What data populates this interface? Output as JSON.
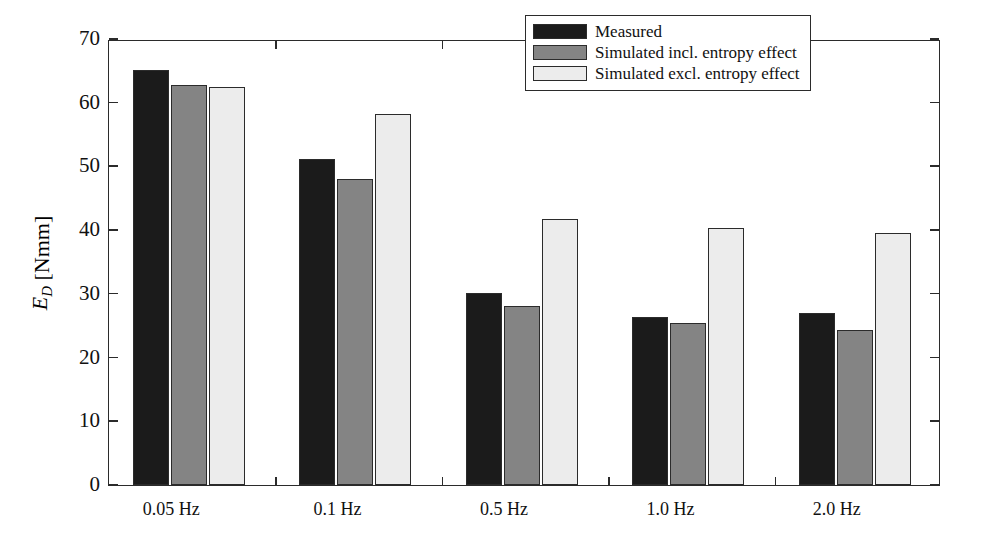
{
  "chart_data": {
    "type": "bar",
    "title": "",
    "xlabel": "",
    "ylabel": "E_D [Nmm]",
    "ylabel_symbol": "E",
    "ylabel_subscript": "D",
    "ylabel_unit": "[Nmm]",
    "categories": [
      "0.05 Hz",
      "0.1 Hz",
      "0.5 Hz",
      "1.0 Hz",
      "2.0 Hz"
    ],
    "ylim": [
      0,
      70
    ],
    "yticks": [
      0,
      10,
      20,
      30,
      40,
      50,
      60,
      70
    ],
    "ytick_labels": [
      "0",
      "10",
      "20",
      "30",
      "40",
      "50",
      "60",
      "70"
    ],
    "grid": false,
    "legend_position": "top-right",
    "series": [
      {
        "name": "Measured",
        "color": "#1b1b1b",
        "values": [
          65.2,
          51.2,
          30.2,
          26.4,
          27.0
        ]
      },
      {
        "name": "Simulated incl. entropy effect",
        "color": "#848484",
        "values": [
          62.8,
          48.1,
          28.1,
          25.4,
          24.3
        ]
      },
      {
        "name": "Simulated excl. entropy effect",
        "color": "#ececec",
        "values": [
          62.4,
          58.2,
          41.8,
          40.3,
          39.6
        ]
      }
    ]
  },
  "legend": {
    "items": [
      {
        "label": "Measured",
        "swatch": "measured"
      },
      {
        "label": "Simulated incl. entropy effect",
        "swatch": "sim-incl"
      },
      {
        "label": "Simulated excl. entropy effect",
        "swatch": "sim-excl"
      }
    ]
  },
  "colors": {
    "axis": "#2b2b2b",
    "measured": "#1b1b1b",
    "simulated_incl": "#848484",
    "simulated_excl": "#ececec",
    "background": "#ffffff"
  }
}
